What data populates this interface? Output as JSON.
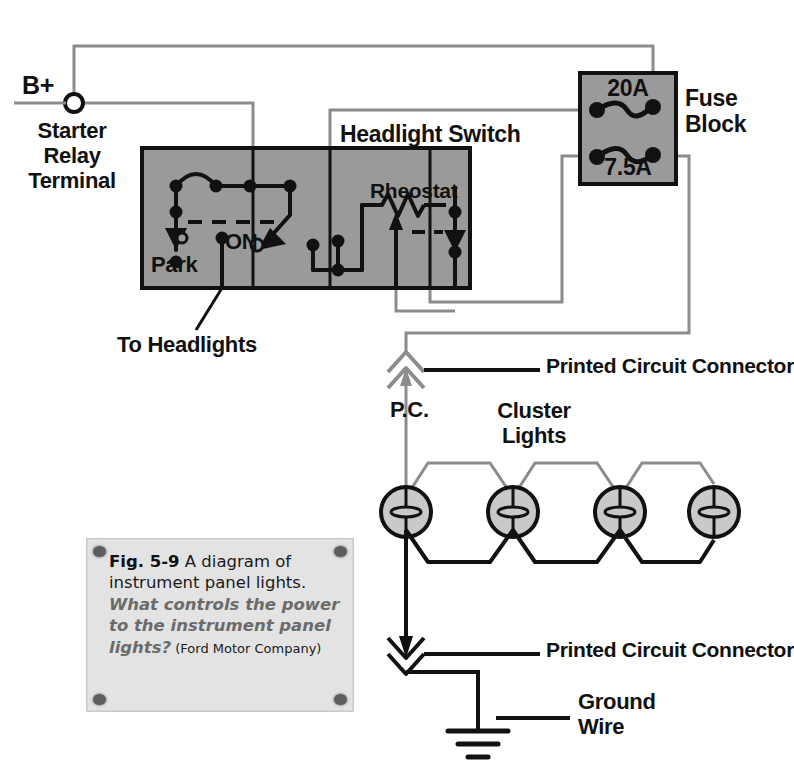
{
  "figure": {
    "title": "Diagram of instrument panel lights",
    "source": "Ford Motor Company"
  },
  "caption": {
    "fig_number": "Fig. 5-9",
    "body": " A diagram of instrument panel lights. ",
    "question": "What controls the power to the instrument panel lights?",
    "credit": " (Ford Motor Company)"
  },
  "labels": {
    "b_plus": "B+",
    "starter_relay_terminal": "Starter\nRelay\nTerminal",
    "headlight_switch": "Headlight Switch",
    "rheostat": "Rheostat",
    "park": "Park",
    "on": "ON",
    "to_headlights": "To Headlights",
    "fuse_block": "Fuse\nBlock",
    "fuse_20a": "20A",
    "fuse_7_5a": "7.5A",
    "printed_circuit_connector_top": "Printed Circuit Connector",
    "printed_circuit_connector_bottom": "Printed Circuit Connector",
    "pc": "P.C.",
    "cluster_lights": "Cluster\nLights",
    "ground_wire": "Ground\nWire"
  },
  "colors": {
    "component_fill": "#9a9a9a",
    "component_stroke": "#111111",
    "wire_gray": "#8c8c8c",
    "wire_black": "#111111",
    "bulb_fill": "#c9c9c9",
    "caption_bg": "#e3e3e3",
    "question_text": "#6b6b6b",
    "text": "#111111"
  },
  "circuit": {
    "components": [
      {
        "name": "headlight-switch",
        "type": "switch-assembly",
        "x": 142,
        "y": 148,
        "width": 328,
        "height": 140
      },
      {
        "name": "fuse-block",
        "type": "fuse-block",
        "x": 580,
        "y": 73,
        "width": 96,
        "height": 111
      },
      {
        "name": "starter-relay-terminal",
        "type": "terminal",
        "x": 74,
        "y": 103
      }
    ],
    "fuses": [
      {
        "rating": "20A",
        "position": "upper"
      },
      {
        "rating": "7.5A",
        "position": "lower"
      }
    ],
    "cluster_light_count": 4,
    "connectors": [
      {
        "name": "printed-circuit-connector-top",
        "direction": "up"
      },
      {
        "name": "printed-circuit-connector-bottom",
        "direction": "down"
      }
    ],
    "ground": {
      "name": "ground-symbol",
      "label": "Ground Wire"
    }
  }
}
